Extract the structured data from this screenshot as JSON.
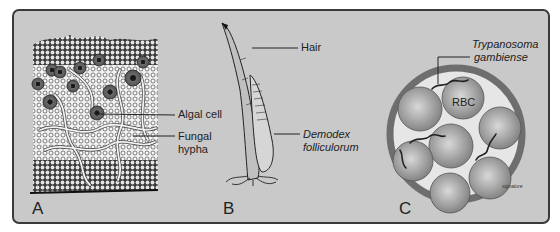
{
  "figure": {
    "panels": [
      {
        "letter": "A",
        "subject": "lichen-cross-section",
        "labels": [
          {
            "text": "Algal cell"
          },
          {
            "text": "Fungal",
            "line2": "hypha"
          }
        ]
      },
      {
        "letter": "B",
        "subject": "hair-follicle-mite",
        "labels": [
          {
            "text": "Hair"
          },
          {
            "text": "Demodex",
            "line2": "folliculorum"
          }
        ]
      },
      {
        "letter": "C",
        "subject": "blood-vessel-trypanosome",
        "labels": [
          {
            "text": "Trypanosoma",
            "line2": "gambiense"
          },
          {
            "text": "RBC"
          }
        ]
      }
    ]
  },
  "colors": {
    "panel_bg": "#c9c9c9",
    "border": "#3a3a3a",
    "rbc": "#8a8a8a",
    "vessel": "#6e6e6e"
  }
}
